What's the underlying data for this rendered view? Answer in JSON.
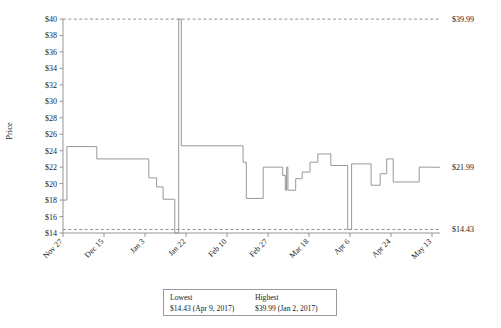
{
  "chart_data": {
    "type": "line",
    "title": "",
    "xlabel": "",
    "ylabel": "Price",
    "ylim": [
      14,
      40
    ],
    "grid": false,
    "legend_position": "bottom",
    "y_ticks": [
      "$14",
      "$16",
      "$18",
      "$20",
      "$22",
      "$24",
      "$26",
      "$28",
      "$30",
      "$32",
      "$34",
      "$36",
      "$38",
      "$40"
    ],
    "y_tick_values": [
      14,
      16,
      18,
      20,
      22,
      24,
      26,
      28,
      30,
      32,
      34,
      36,
      38,
      40
    ],
    "x_ticks": [
      "Nov 27",
      "Dec 15",
      "Jan 3",
      "Jan 22",
      "Feb 10",
      "Feb 27",
      "Mar 18",
      "Apr 6",
      "Apr 24",
      "May 13"
    ],
    "reference_lines": [
      {
        "label": "$39.99",
        "value": 39.99,
        "style": "dashed"
      },
      {
        "label": "$14.43",
        "value": 14.43,
        "style": "dashed"
      }
    ],
    "annotations": [
      {
        "label": "$21.99",
        "value": 21.99,
        "position": "right-end"
      }
    ],
    "series": [
      {
        "name": "Price",
        "step": "post",
        "points": [
          [
            0.0,
            18.0
          ],
          [
            0.6,
            24.5
          ],
          [
            5.0,
            24.5
          ],
          [
            5.2,
            23.0
          ],
          [
            13.0,
            23.0
          ],
          [
            13.2,
            20.7
          ],
          [
            14.2,
            20.7
          ],
          [
            14.4,
            19.6
          ],
          [
            15.2,
            19.6
          ],
          [
            15.4,
            18.1
          ],
          [
            17.0,
            18.1
          ],
          [
            17.2,
            14.0
          ],
          [
            17.6,
            14.0
          ],
          [
            17.8,
            39.99
          ],
          [
            18.0,
            39.99
          ],
          [
            18.2,
            24.6
          ],
          [
            27.5,
            24.6
          ],
          [
            27.7,
            22.6
          ],
          [
            28.0,
            22.6
          ],
          [
            28.2,
            18.2
          ],
          [
            30.6,
            18.2
          ],
          [
            30.8,
            22.0
          ],
          [
            33.6,
            22.0
          ],
          [
            33.8,
            21.0
          ],
          [
            34.0,
            21.0
          ],
          [
            34.2,
            19.2
          ],
          [
            34.4,
            22.0
          ],
          [
            34.6,
            19.2
          ],
          [
            35.6,
            19.2
          ],
          [
            35.8,
            20.6
          ],
          [
            36.6,
            20.6
          ],
          [
            36.8,
            21.4
          ],
          [
            37.8,
            21.4
          ],
          [
            38.0,
            22.6
          ],
          [
            39.0,
            22.6
          ],
          [
            39.2,
            23.6
          ],
          [
            41.0,
            23.6
          ],
          [
            41.2,
            22.2
          ],
          [
            43.6,
            22.2
          ],
          [
            43.8,
            14.43
          ],
          [
            44.2,
            14.43
          ],
          [
            44.4,
            22.4
          ],
          [
            47.2,
            22.4
          ],
          [
            47.4,
            19.8
          ],
          [
            48.6,
            19.8
          ],
          [
            48.8,
            21.2
          ],
          [
            49.6,
            21.2
          ],
          [
            49.8,
            23.0
          ],
          [
            50.6,
            23.0
          ],
          [
            50.8,
            20.2
          ],
          [
            54.6,
            20.2
          ],
          [
            54.8,
            22.0
          ],
          [
            56.4,
            22.0
          ],
          [
            56.6,
            21.99
          ],
          [
            58.0,
            21.99
          ]
        ]
      }
    ],
    "summary": {
      "lowest_label": "Lowest",
      "lowest_value": "$14.43 (Apr 9, 2017)",
      "highest_label": "Highest",
      "highest_value": "$39.99 (Jan 2, 2017)"
    }
  }
}
